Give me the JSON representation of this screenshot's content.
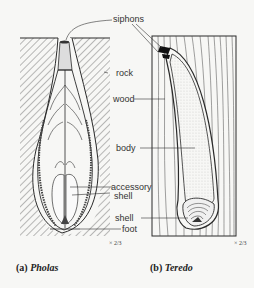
{
  "figure": {
    "panels": [
      {
        "id": "a",
        "caption_prefix": "(a)",
        "caption_name": "Pholas",
        "scale": "× 2/3"
      },
      {
        "id": "b",
        "caption_prefix": "(b)",
        "caption_name": "Teredo",
        "scale": "× 2/3"
      }
    ],
    "labels": {
      "siphons": "siphons",
      "rock": "rock",
      "wood": "wood",
      "body": "body",
      "accessory_shell_1": "accessory",
      "accessory_shell_2": "shell",
      "shell": "shell",
      "foot": "foot"
    },
    "colors": {
      "line": "#2a2a2a",
      "hatch": "#555555",
      "background": "#f7f7f5"
    }
  }
}
